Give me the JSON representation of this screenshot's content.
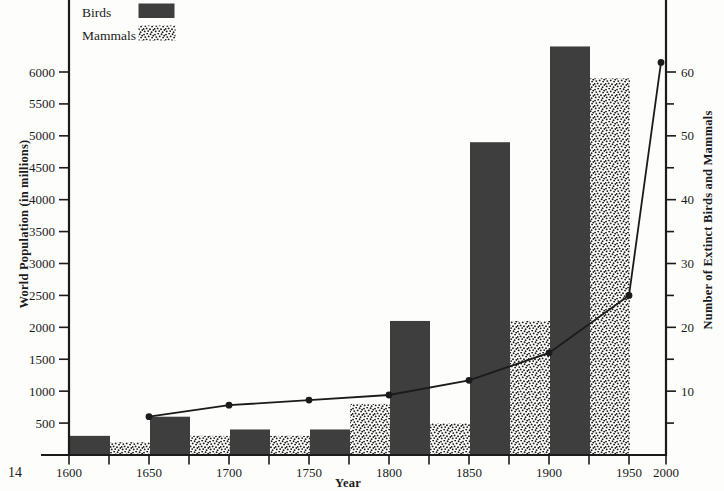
{
  "page": {
    "number": "14"
  },
  "colors": {
    "ink": "#1b1b1b",
    "bar_solid": "#3e3e3e",
    "background": "#fdfdfc"
  },
  "legend": {
    "items": [
      {
        "label": "Birds",
        "swatch": "solid-dark-bar"
      },
      {
        "label": "Mammals",
        "swatch": "stippled-dot-bar"
      }
    ]
  },
  "chart_data": {
    "type": "bar",
    "subtype": "combo-bar-line-dual-axis",
    "x_axis": {
      "label": "Year",
      "range": [
        1600,
        2000
      ],
      "major_tick_step": 50,
      "minor_tick_step": 25,
      "tick_labels": [
        "1600",
        "1650",
        "1700",
        "1750",
        "1800",
        "1850",
        "1900",
        "1950",
        "2000"
      ],
      "compressed_final_interval": true
    },
    "y_left": {
      "label": "World Population (in millions)",
      "range": [
        0,
        6400
      ],
      "tick_step": 500,
      "tick_labels": [
        "500",
        "1000",
        "1500",
        "2000",
        "2500",
        "3000",
        "3500",
        "4000",
        "4500",
        "5000",
        "5500",
        "6000"
      ]
    },
    "y_right": {
      "label": "Number of Extinct Birds and Mammals",
      "range": [
        0,
        64
      ],
      "tick_step": 10,
      "minor_tick_step": 5,
      "tick_labels": [
        "10",
        "20",
        "30",
        "40",
        "50",
        "60"
      ]
    },
    "bars": {
      "axis": "right",
      "bar_width_years": 25,
      "series": [
        {
          "name": "Birds",
          "style": "solid",
          "start_years": [
            1600,
            1650,
            1700,
            1750,
            1800,
            1850,
            1900
          ],
          "values": [
            3,
            6,
            4,
            4,
            21,
            49,
            64
          ]
        },
        {
          "name": "Mammals",
          "style": "stipple",
          "start_years": [
            1625,
            1675,
            1725,
            1775,
            1825,
            1875,
            1925
          ],
          "values": [
            2,
            3,
            3,
            8,
            5,
            21,
            59
          ]
        }
      ]
    },
    "line": {
      "name": "World population (left axis, millions)",
      "marker": "filled-circle",
      "x": [
        1650,
        1700,
        1750,
        1800,
        1850,
        1900,
        1950,
        2000
      ],
      "values": [
        600,
        780,
        860,
        940,
        1170,
        1600,
        2500,
        6150
      ]
    }
  }
}
